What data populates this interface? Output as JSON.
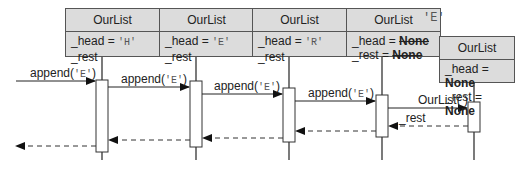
{
  "objects": [
    {
      "title": "OurList",
      "head_label": "_head = ",
      "head_value": "'H'",
      "rest_label": "_rest"
    },
    {
      "title": "OurList",
      "head_label": "_head = ",
      "head_value": "'E'",
      "rest_label": "_rest"
    },
    {
      "title": "OurList",
      "head_label": "_head = ",
      "head_value": "'R'",
      "rest_label": "_rest"
    },
    {
      "title": "OurList",
      "head_label": "_head = ",
      "head_value": "None",
      "rest_label": "_rest = ",
      "rest_value": "None",
      "new_head": "'E'"
    },
    {
      "title": "OurList",
      "head_label": "_head = ",
      "head_value": "None",
      "rest_label": "_rest = ",
      "rest_value": "None"
    }
  ],
  "messages": [
    {
      "label": "append(",
      "arg": "'E'",
      "close": ")"
    },
    {
      "label": "append(",
      "arg": "'E'",
      "close": ")"
    },
    {
      "label": "append(",
      "arg": "'E'",
      "close": ")"
    },
    {
      "label": "append(",
      "arg": "'E'",
      "close": ")"
    },
    {
      "label": "OurList( )"
    },
    {
      "label": "_rest"
    }
  ]
}
